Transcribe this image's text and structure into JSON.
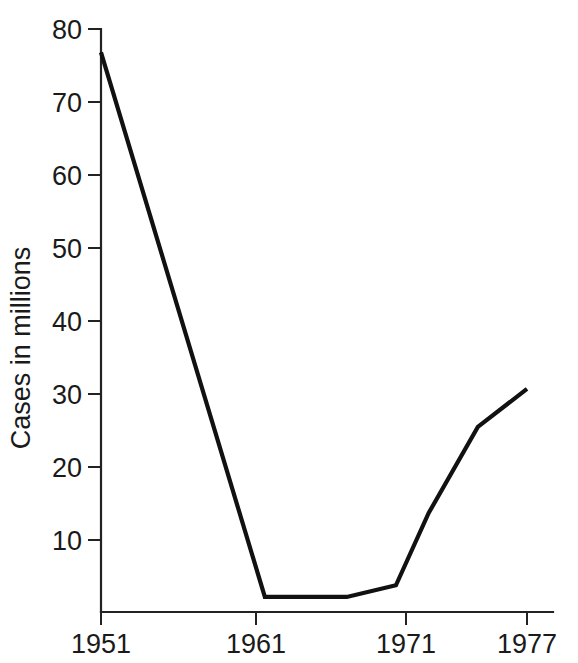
{
  "chart_data": {
    "type": "line",
    "title": "",
    "subtitle": "",
    "xlabel": "",
    "ylabel": "Cases in millions",
    "x": [
      1951,
      1961,
      1966,
      1969,
      1971,
      1974,
      1977
    ],
    "values": [
      76.8,
      2.2,
      2.2,
      3.8,
      13.7,
      25.5,
      30.7
    ],
    "series": [
      {
        "name": "Cases in millions",
        "points": [
          {
            "x": 1951,
            "y": 76.8
          },
          {
            "x": 1961,
            "y": 2.2
          },
          {
            "x": 1966,
            "y": 2.2
          },
          {
            "x": 1969,
            "y": 3.8
          },
          {
            "x": 1971,
            "y": 13.7
          },
          {
            "x": 1974,
            "y": 25.5
          },
          {
            "x": 1977,
            "y": 30.7
          }
        ]
      }
    ],
    "xlim": [
      1951,
      1978.7
    ],
    "ylim": [
      0,
      80
    ],
    "xticks": [
      1951,
      1961,
      1971,
      1977
    ],
    "xticklabels": [
      "1951",
      "1961",
      "1971",
      "1977"
    ],
    "yticks": [
      10,
      20,
      30,
      40,
      50,
      60,
      70,
      80
    ],
    "yticklabels": [
      "10",
      "20",
      "30",
      "40",
      "50",
      "60",
      "70",
      "80"
    ],
    "grid": false,
    "legend": false,
    "legend_position": "none",
    "line_color": "#111111",
    "axis_color": "#222222",
    "background_color": "#ffffff"
  },
  "axes": {
    "y_title": "Cases in millions",
    "y_tick_labels": [
      "80",
      "70",
      "60",
      "50",
      "40",
      "30",
      "20",
      "10"
    ],
    "x_tick_labels": [
      "1951",
      "1961",
      "1971",
      "1977"
    ]
  }
}
